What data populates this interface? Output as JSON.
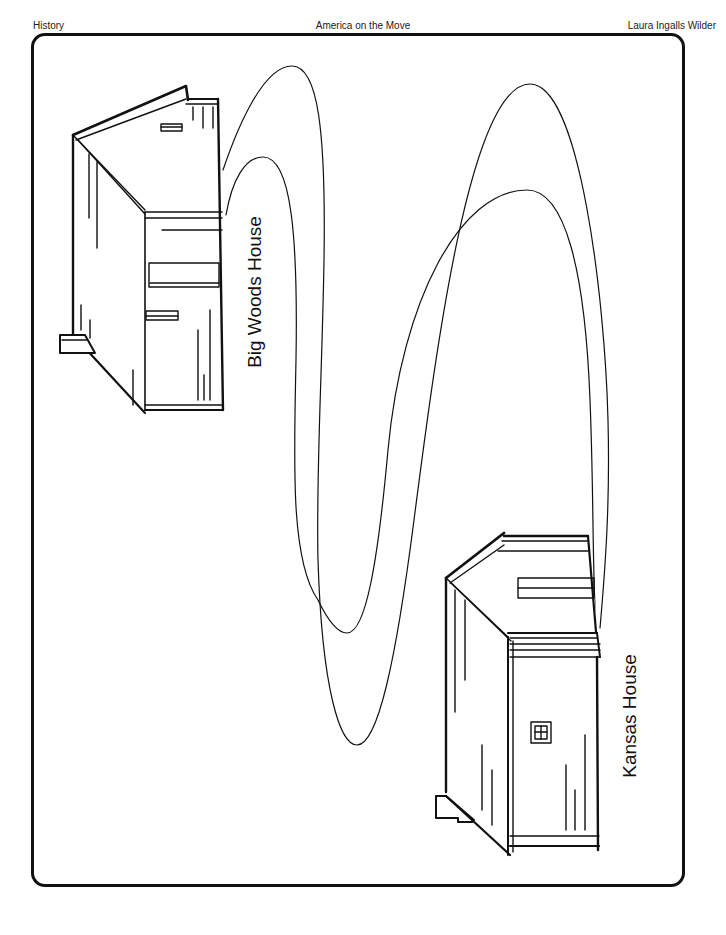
{
  "header": {
    "subject": "History",
    "unit": "America on the Move",
    "topic": "Laura Ingalls Wilder"
  },
  "map": {
    "houses": [
      {
        "id": "big-woods",
        "label": "Big Woods House"
      },
      {
        "id": "kansas",
        "label": "Kansas House"
      }
    ],
    "path": {
      "description": "winding trail from Big Woods House to Kansas House"
    }
  },
  "colors": {
    "ink": "#111111",
    "paper": "#ffffff"
  }
}
